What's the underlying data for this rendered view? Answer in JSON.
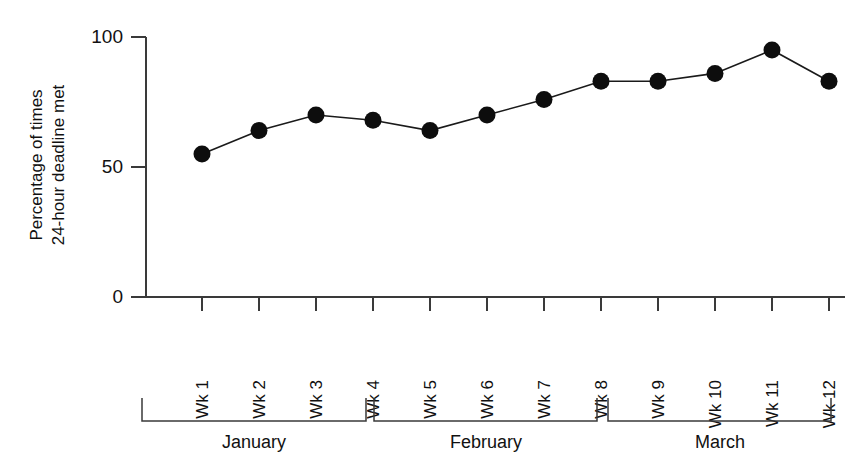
{
  "chart_data": {
    "type": "line",
    "title": "",
    "subtitle": "",
    "xlabel": "",
    "ylabel": "Percentage of times 24-hour deadline met",
    "ylabel_line1": "Percentage of times",
    "ylabel_line2": "24-hour deadline met",
    "categories": [
      "Wk 1",
      "Wk 2",
      "Wk 3",
      "Wk 4",
      "Wk 5",
      "Wk 6",
      "Wk 7",
      "Wk 8",
      "Wk 9",
      "Wk 10",
      "Wk 11",
      "Wk 12"
    ],
    "values": [
      55,
      64,
      70,
      68,
      64,
      70,
      76,
      83,
      83,
      86,
      95,
      83
    ],
    "series": [
      {
        "name": "Percentage of times 24-hour deadline met",
        "values": [
          55,
          64,
          70,
          68,
          64,
          70,
          76,
          83,
          83,
          86,
          95,
          83
        ]
      }
    ],
    "ylim": [
      0,
      100
    ],
    "yticks": [
      0,
      50,
      100
    ],
    "ytick_labels": [
      "0",
      "50",
      "100"
    ],
    "grid": false,
    "legend": false,
    "legend_position": "none",
    "marker": "filled-circle",
    "marker_color": "#0d0d0d",
    "line_color": "#1a1a1a",
    "groups": [
      {
        "label": "January",
        "start_index": 0,
        "end_index": 3
      },
      {
        "label": "February",
        "start_index": 4,
        "end_index": 7
      },
      {
        "label": "March",
        "start_index": 8,
        "end_index": 11
      }
    ],
    "annotations": []
  },
  "colors": {
    "background": "#ffffff",
    "axis": "#3a3a3a",
    "marker": "#0d0d0d",
    "line": "#1a1a1a",
    "text": "#111111"
  }
}
